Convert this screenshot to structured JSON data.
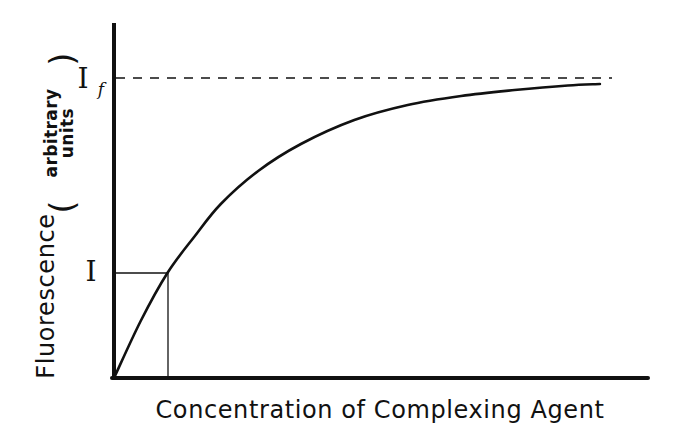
{
  "chart_data": {
    "type": "line",
    "title": "",
    "xlabel": "Concentration of Complexing Agent",
    "ylabel": "Fluorescence",
    "ylabel_units": [
      "arbitrary",
      "units"
    ],
    "grid": false,
    "legend": null,
    "xlim": [
      0,
      1
    ],
    "ylim": [
      0,
      1.0
    ],
    "axis_ticks": "none (qualitative axes)",
    "annotations": [
      {
        "label": "I",
        "subscript": "",
        "y_fraction_of_If": 0.35,
        "marker": "horizontal and vertical guide lines from axes to curve at x≈0.10"
      },
      {
        "label": "I",
        "subscript": "f",
        "y_fraction_of_If": 1.0,
        "marker": "dashed horizontal asymptote"
      }
    ],
    "series": [
      {
        "name": "Fluorescence vs complexing agent",
        "description": "Saturation curve rising from origin toward asymptote If",
        "x": [
          0.0,
          0.05,
          0.1,
          0.15,
          0.2,
          0.27,
          0.35,
          0.45,
          0.55,
          0.65,
          0.75,
          0.85,
          0.91
        ],
        "y": [
          0.0,
          0.19,
          0.35,
          0.47,
          0.58,
          0.69,
          0.78,
          0.86,
          0.91,
          0.94,
          0.96,
          0.975,
          0.98
        ]
      }
    ]
  },
  "labels": {
    "x_axis": "Concentration of Complexing Agent",
    "y_axis_main": "Fluorescence",
    "y_axis_units_line1": "arbitrary",
    "y_axis_units_line2": "units",
    "paren_open": "(",
    "paren_close": ")",
    "i_label": "I",
    "if_label": "I",
    "if_subscript": "f"
  },
  "colors": {
    "ink": "#111111",
    "background": "#ffffff"
  }
}
